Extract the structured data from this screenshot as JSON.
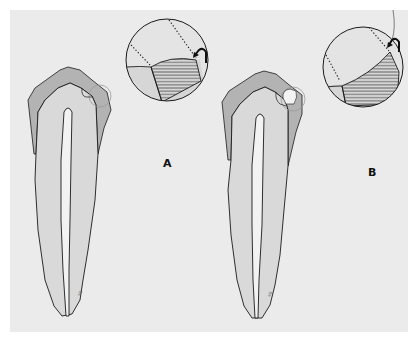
{
  "figure": {
    "type": "dental illustration",
    "panels": [
      {
        "id": "A",
        "label": "A",
        "tooth": "longitudinal section of tooth with enamel cap and pulp canal",
        "inset": "magnified circular detail showing restoration (hatched) at margin with curved arrow"
      },
      {
        "id": "B",
        "label": "B",
        "tooth": "longitudinal section of tooth with enamel cap and pulp canal",
        "inset": "magnified circular detail showing restoration (hatched) at margin with curved arrow"
      }
    ],
    "colors": {
      "background": "#ebebeb",
      "border": "#ffffff",
      "dentin": "#dadada",
      "enamel": "#b9b9b9",
      "pulp": "#f2f2f2",
      "outline": "#1a1a1a",
      "hatch": "#2a2a2a"
    }
  }
}
